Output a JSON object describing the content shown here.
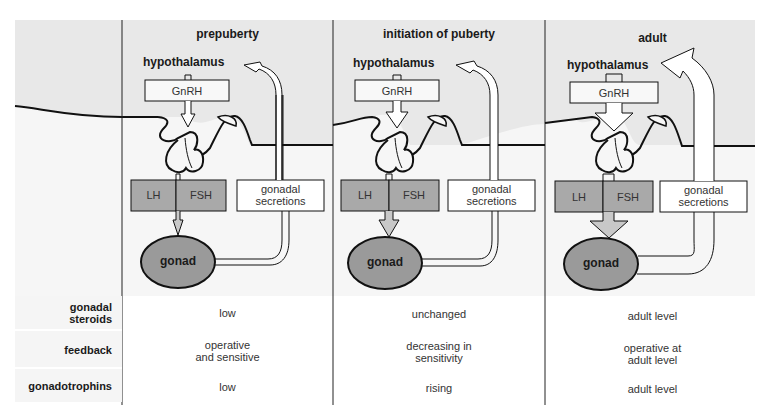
{
  "columns": [
    {
      "title": "prepuberty",
      "hypothalamus": "hypothalamus",
      "gnrh": "GnRH",
      "lh": "LH",
      "fsh": "FSH",
      "secretions_line1": "gonadal",
      "secretions_line2": "secretions",
      "gonad": "gonad",
      "arrow_size": "small"
    },
    {
      "title": "initiation of puberty",
      "hypothalamus": "hypothalamus",
      "gnrh": "GnRH",
      "lh": "LH",
      "fsh": "FSH",
      "secretions_line1": "gonadal",
      "secretions_line2": "secretions",
      "gonad": "gonad",
      "arrow_size": "medium"
    },
    {
      "title": "adult",
      "hypothalamus": "hypothalamus",
      "gnrh": "GnRH",
      "lh": "LH",
      "fsh": "FSH",
      "secretions_line1": "gonadal",
      "secretions_line2": "secretions",
      "gonad": "gonad",
      "arrow_size": "large"
    }
  ],
  "table": {
    "rows": [
      {
        "label_line1": "gonadal",
        "label_line2": "steroids",
        "values": [
          {
            "l1": "low",
            "l2": ""
          },
          {
            "l1": "unchanged",
            "l2": ""
          },
          {
            "l1": "adult level",
            "l2": ""
          }
        ]
      },
      {
        "label_line1": "feedback",
        "label_line2": "",
        "values": [
          {
            "l1": "operative",
            "l2": "and sensitive"
          },
          {
            "l1": "decreasing in",
            "l2": "sensitivity"
          },
          {
            "l1": "operative at",
            "l2": "adult level"
          }
        ]
      },
      {
        "label_line1": "gonadotrophins",
        "label_line2": "",
        "values": [
          {
            "l1": "low",
            "l2": ""
          },
          {
            "l1": "rising",
            "l2": ""
          },
          {
            "l1": "adult level",
            "l2": ""
          }
        ]
      }
    ]
  },
  "colors": {
    "upper_bg": "#e9e9e9",
    "lower_bg": "#f7f7f7",
    "hormone_box": "#a9a9a9",
    "gonad": "#9a9a9a",
    "line": "#111111"
  }
}
